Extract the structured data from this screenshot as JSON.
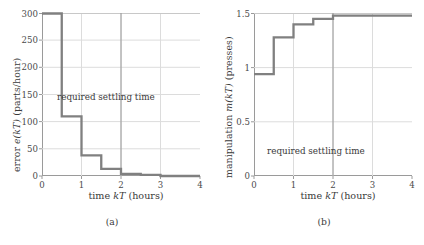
{
  "figure": {
    "background": "#ffffff",
    "line_color": "#808080",
    "axis_color": "#9a9a9a",
    "grid_color": "#d8d8d8",
    "text_color": "#3a3a3a"
  },
  "panels": [
    {
      "caption": "(a)",
      "annotation": "required settling time",
      "ylabel_pre": "error ",
      "ylabel_it": "e(kT)",
      "ylabel_post": " (parts/hour)",
      "xlabel_pre": "time ",
      "xlabel_it": "kT",
      "xlabel_post": " (hours)"
    },
    {
      "caption": "(b)",
      "annotation": "required settling time",
      "ylabel_pre": "manipulation ",
      "ylabel_it": "m(kT)",
      "ylabel_post": " (presses)",
      "xlabel_pre": "time ",
      "xlabel_it": "kT",
      "xlabel_post": " (hours)"
    }
  ],
  "chart_data": [
    {
      "type": "line",
      "subtype": "step-post",
      "panel": "(a)",
      "title": "",
      "xlabel": "time kT (hours)",
      "ylabel": "error e(kT) (parts/hour)",
      "xlim": [
        0,
        4
      ],
      "ylim": [
        0,
        300
      ],
      "xticks": [
        0,
        1,
        2,
        3,
        4
      ],
      "yticks": [
        0,
        50,
        100,
        150,
        200,
        250,
        300
      ],
      "xtick_labels": [
        "0",
        "1",
        "2",
        "3",
        "4"
      ],
      "ytick_labels": [
        "0",
        "50",
        "100",
        "150",
        "200",
        "250",
        "300"
      ],
      "grid": true,
      "legend": "none",
      "step_width": 0.5,
      "x": [
        0,
        0.5,
        1.0,
        1.5,
        2.0,
        2.5,
        3.0,
        3.5,
        4.0
      ],
      "values": [
        300,
        110,
        38,
        13,
        4,
        2,
        0,
        0,
        0
      ],
      "annotations": [
        {
          "text": "required settling time",
          "type": "vline-label",
          "x": 2.0,
          "label_x": 1.05,
          "label_y": 150
        }
      ]
    },
    {
      "type": "line",
      "subtype": "step-post",
      "panel": "(b)",
      "title": "",
      "xlabel": "time kT (hours)",
      "ylabel": "manipulation m(kT) (presses)",
      "xlim": [
        0,
        4
      ],
      "ylim": [
        0,
        1.5
      ],
      "xticks": [
        0,
        1,
        2,
        3,
        4
      ],
      "yticks": [
        0,
        0.5,
        1,
        1.5
      ],
      "xtick_labels": [
        "0",
        "1",
        "2",
        "3",
        "4"
      ],
      "ytick_labels": [
        "0",
        "0.5",
        "1",
        "1.5"
      ],
      "grid": true,
      "legend": "none",
      "step_width": 0.5,
      "x": [
        0,
        0.5,
        1.0,
        1.5,
        2.0,
        2.5,
        3.0,
        3.5,
        4.0
      ],
      "values": [
        0.94,
        1.28,
        1.4,
        1.45,
        1.48,
        1.48,
        1.48,
        1.48,
        1.48
      ],
      "annotations": [
        {
          "text": "required settling time",
          "type": "vline-label",
          "x": 2.0,
          "label_x": 1.0,
          "label_y": 0.42
        }
      ]
    }
  ]
}
